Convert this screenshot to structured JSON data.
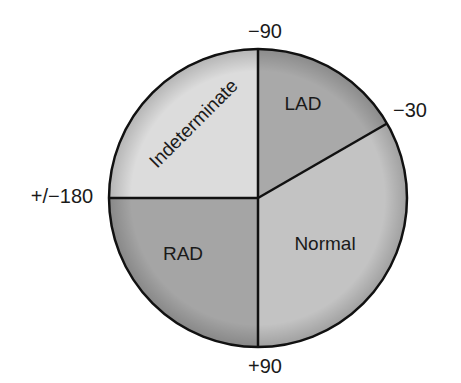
{
  "diagram": {
    "type": "axis-quadrant-circle",
    "center": [
      258,
      198
    ],
    "radius": 149,
    "boundary_angles_deg": [
      -90,
      -30,
      90,
      180
    ],
    "angle_labels": [
      {
        "id": "minus-90",
        "text": "−90",
        "x": 265,
        "y": 38
      },
      {
        "id": "minus-30",
        "text": "−30",
        "x": 410,
        "y": 117
      },
      {
        "id": "plus-minus-180",
        "text": "+/−180",
        "x": 62,
        "y": 203
      },
      {
        "id": "plus-90",
        "text": "+90",
        "x": 265,
        "y": 373
      }
    ],
    "sectors": [
      {
        "id": "indeterminate",
        "label": "Indeterminate",
        "from_deg": 180,
        "to_deg": 270,
        "color": "#dcdcdc",
        "label_x": 198,
        "label_y": 128,
        "label_rotate": -45
      },
      {
        "id": "lad",
        "label": "LAD",
        "from_deg": -90,
        "to_deg": -30,
        "color": "#a9a9a9",
        "label_x": 303,
        "label_y": 110,
        "label_rotate": 0
      },
      {
        "id": "normal",
        "label": "Normal",
        "from_deg": -30,
        "to_deg": 90,
        "color": "#c3c3c3",
        "label_x": 325,
        "label_y": 250,
        "label_rotate": 0
      },
      {
        "id": "rad",
        "label": "RAD",
        "from_deg": 90,
        "to_deg": 180,
        "color": "#a5a5a5",
        "label_x": 183,
        "label_y": 260,
        "label_rotate": 0
      }
    ],
    "stroke_color": "#111111"
  }
}
